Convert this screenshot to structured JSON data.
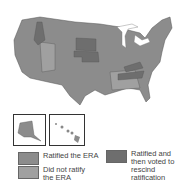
{
  "map": {
    "title": "ERA ratification by state",
    "colors": {
      "ratified": "#8c8c8c",
      "not_ratified": "#9e9e9e",
      "rescinded": "#6e6e6e",
      "water": "#ffffff",
      "border": "#555555"
    }
  },
  "insets": [
    {
      "name": "alaska"
    },
    {
      "name": "hawaii"
    }
  ],
  "legend": [
    {
      "key": "ratified",
      "label": "Ratified the ERA",
      "color": "#8c8c8c"
    },
    {
      "key": "not_ratified",
      "label": "Did not ratify the ERA",
      "color": "#a0a0a0"
    },
    {
      "key": "rescinded",
      "label": "Ratified and then voted to rescind ratification",
      "color": "#6e6e6e"
    }
  ]
}
